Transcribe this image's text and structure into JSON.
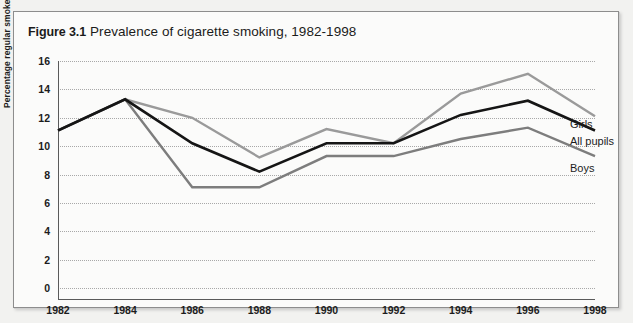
{
  "figure": {
    "number": "Figure 3.1",
    "caption": "Prevalence of cigarette smoking, 1982-1998"
  },
  "labels": {
    "girls": "Girls",
    "all_pupils": "All pupils",
    "boys": "Boys"
  },
  "colors": {
    "girls": "#9a9a9a",
    "all_pupils": "#151515",
    "boys": "#7d7d7d",
    "gridline": "#a8a8a8",
    "axis": "#5a5a5a",
    "frame": "#8d8d8d",
    "plot_background": "#fbfbfa",
    "page_background": "#f2f2f0"
  },
  "chart_data": {
    "type": "line",
    "title": "Prevalence of cigarette smoking, 1982-1998",
    "xlabel": "",
    "ylabel": "Percentage regular smokers",
    "x": [
      1982,
      1984,
      1986,
      1988,
      1990,
      1992,
      1994,
      1996,
      1998
    ],
    "xtick_labels": [
      "1982",
      "1984",
      "1986",
      "1988",
      "1990",
      "1992",
      "1994",
      "1996",
      "1998"
    ],
    "ytick_labels": [
      "0",
      "2",
      "4",
      "6",
      "8",
      "10",
      "12",
      "14",
      "16"
    ],
    "yticks": [
      0,
      2,
      4,
      6,
      8,
      10,
      12,
      14,
      16
    ],
    "ylim": [
      0,
      16
    ],
    "xlim": [
      1982,
      1998
    ],
    "grid": true,
    "grid_axis": "y",
    "legend_position": "right-inline",
    "series": [
      {
        "name": "Girls",
        "color": "#9a9a9a",
        "values": [
          11.1,
          13.3,
          12.0,
          9.2,
          11.2,
          10.2,
          13.7,
          15.1,
          12.1
        ]
      },
      {
        "name": "All pupils",
        "color": "#151515",
        "values": [
          11.1,
          13.3,
          10.2,
          8.2,
          10.2,
          10.2,
          12.2,
          13.2,
          11.1
        ]
      },
      {
        "name": "Boys",
        "color": "#7d7d7d",
        "values": [
          11.1,
          13.3,
          7.1,
          7.1,
          9.3,
          9.3,
          10.5,
          11.3,
          9.3
        ]
      }
    ]
  }
}
